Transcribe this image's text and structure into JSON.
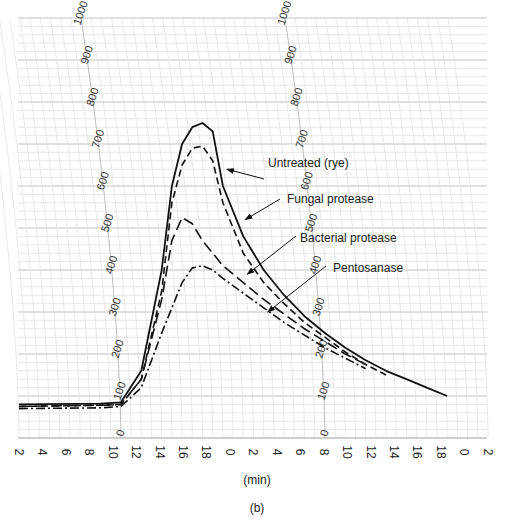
{
  "chart_data": {
    "type": "line",
    "title": "",
    "subtitle": "(b)",
    "xlabel": "(min)",
    "ylabel": "",
    "x_tick_labels": [
      "2",
      "4",
      "6",
      "8",
      "10",
      "12",
      "14",
      "16",
      "18",
      "0",
      "2",
      "4",
      "6",
      "8",
      "10",
      "12",
      "14",
      "16",
      "18",
      "0",
      "2"
    ],
    "x_range": [
      0,
      46
    ],
    "y_range": [
      0,
      1000
    ],
    "arc_scale_labels": [
      "0",
      "100",
      "200",
      "300",
      "400",
      "500",
      "600",
      "700",
      "800",
      "900",
      "1000"
    ],
    "grid": true,
    "series": [
      {
        "name": "Untreated (rye)",
        "style": "solid",
        "points": [
          [
            0,
            80
          ],
          [
            8,
            82
          ],
          [
            10,
            85
          ],
          [
            12,
            160
          ],
          [
            14,
            400
          ],
          [
            15,
            600
          ],
          [
            16,
            700
          ],
          [
            17,
            740
          ],
          [
            18,
            750
          ],
          [
            19,
            730
          ],
          [
            20,
            600
          ],
          [
            22,
            480
          ],
          [
            24,
            400
          ],
          [
            26,
            340
          ],
          [
            28,
            290
          ],
          [
            30,
            250
          ],
          [
            32,
            215
          ],
          [
            34,
            185
          ],
          [
            36,
            160
          ],
          [
            38,
            140
          ],
          [
            40,
            120
          ],
          [
            42,
            100
          ]
        ]
      },
      {
        "name": "Fungal protease",
        "style": "dashed",
        "points": [
          [
            0,
            75
          ],
          [
            8,
            78
          ],
          [
            10,
            80
          ],
          [
            12,
            140
          ],
          [
            14,
            350
          ],
          [
            15,
            560
          ],
          [
            16,
            650
          ],
          [
            17,
            690
          ],
          [
            18,
            695
          ],
          [
            19,
            660
          ],
          [
            20,
            560
          ],
          [
            22,
            440
          ],
          [
            24,
            370
          ],
          [
            26,
            320
          ],
          [
            28,
            275
          ],
          [
            30,
            240
          ],
          [
            32,
            205
          ],
          [
            34,
            175
          ],
          [
            36,
            150
          ]
        ]
      },
      {
        "name": "Bacterial protease",
        "style": "long-dash",
        "points": [
          [
            0,
            75
          ],
          [
            8,
            78
          ],
          [
            10,
            80
          ],
          [
            12,
            140
          ],
          [
            14,
            330
          ],
          [
            15,
            470
          ],
          [
            16,
            525
          ],
          [
            17,
            510
          ],
          [
            18,
            470
          ],
          [
            20,
            410
          ],
          [
            22,
            370
          ],
          [
            24,
            330
          ],
          [
            26,
            295
          ],
          [
            28,
            260
          ],
          [
            30,
            230
          ],
          [
            32,
            200
          ],
          [
            34,
            175
          ]
        ]
      },
      {
        "name": "Pentosanase",
        "style": "dash-dot",
        "points": [
          [
            0,
            70
          ],
          [
            8,
            72
          ],
          [
            10,
            75
          ],
          [
            12,
            120
          ],
          [
            14,
            250
          ],
          [
            16,
            370
          ],
          [
            17,
            405
          ],
          [
            18,
            410
          ],
          [
            19,
            400
          ],
          [
            20,
            380
          ],
          [
            22,
            345
          ],
          [
            24,
            310
          ],
          [
            26,
            275
          ],
          [
            28,
            245
          ],
          [
            30,
            215
          ],
          [
            32,
            190
          ],
          [
            34,
            165
          ]
        ]
      }
    ],
    "legend": [
      {
        "label": "Untreated (rye)"
      },
      {
        "label": "Fungal protease"
      },
      {
        "label": "Bacterial protease"
      },
      {
        "label": "Pentosanase"
      }
    ],
    "legend_placement": "inline-annotations"
  }
}
